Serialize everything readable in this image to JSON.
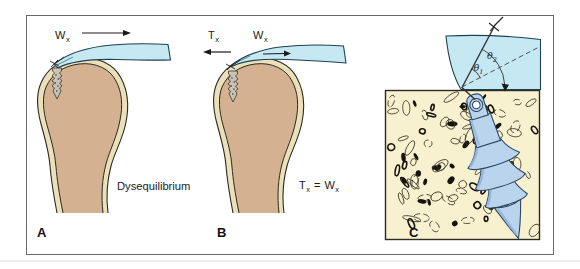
{
  "figure": {
    "panel_a": {
      "letter": "A",
      "caption": "Dysequilibrium",
      "force_w": {
        "main": "W",
        "sub": "x"
      }
    },
    "panel_b": {
      "letter": "B",
      "force_t": {
        "main": "T",
        "sub": "x"
      },
      "force_w": {
        "main": "W",
        "sub": "x"
      },
      "equation": {
        "lhs_main": "T",
        "lhs_sub": "x",
        "equals": "=",
        "rhs_main": "W",
        "rhs_sub": "x"
      }
    },
    "panel_c": {
      "letter": "C",
      "theta1": {
        "main": "θ",
        "sub": "1"
      },
      "theta2": {
        "main": "θ",
        "sub": "2"
      }
    }
  },
  "colors": {
    "tendon": "#c6e8f2",
    "tendon_outline": "#1e4150",
    "cortical_bone": "#ece0ba",
    "medullary_bone": "#d4b191",
    "cancellous_bg": "#f8f1cf",
    "anchor_body": "#bad4ee",
    "anchor_shade": "#8fb2da",
    "screw_metal": "#c8c3b4",
    "outline": "#2c2a22",
    "frame_border": "#686868"
  }
}
